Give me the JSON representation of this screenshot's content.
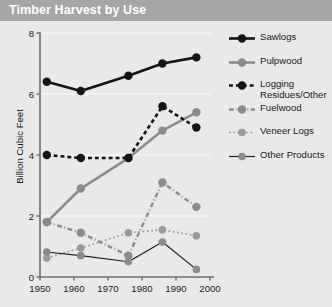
{
  "titlebar": {
    "title": "Timber Harvest by Use"
  },
  "chart_data": {
    "type": "line",
    "title": "Timber Harvest by Use",
    "xlabel": "",
    "ylabel": "Billion Cubic Feet",
    "xlim": [
      1950,
      2000
    ],
    "ylim": [
      0,
      8
    ],
    "xticks": [
      1950,
      1960,
      1970,
      1980,
      1990,
      2000
    ],
    "yticks": [
      0,
      2,
      4,
      6,
      8
    ],
    "xtick_labels": [
      "1950",
      "1960",
      "1970",
      "1980",
      "1990",
      "2000"
    ],
    "ytick_labels": [
      "0",
      "2",
      "4",
      "6",
      "8"
    ],
    "grid": "horizontal",
    "legend_position": "right",
    "x": [
      1952,
      1962,
      1976,
      1986,
      1996
    ],
    "series": [
      {
        "name": "Sawlogs",
        "values": [
          6.4,
          6.1,
          6.6,
          7.0,
          7.2
        ],
        "color": "#141414",
        "line": "solid",
        "width": 2.6,
        "marker": "circle",
        "marker_color": "#141414",
        "marker_size": 4.2
      },
      {
        "name": "Pulpwood",
        "values": [
          1.8,
          2.9,
          3.9,
          4.8,
          5.4
        ],
        "color": "#8c8c8c",
        "line": "solid",
        "width": 2.6,
        "marker": "circle",
        "marker_color": "#8c8c8c",
        "marker_size": 4.2
      },
      {
        "name": "Logging Residues/Other",
        "values": [
          4.0,
          3.9,
          3.9,
          5.6,
          4.9
        ],
        "color": "#141414",
        "line": "dashed",
        "width": 2.6,
        "marker": "circle",
        "marker_color": "#141414",
        "marker_size": 4.2
      },
      {
        "name": "Fuelwood",
        "values": [
          1.8,
          1.45,
          0.7,
          3.1,
          2.3
        ],
        "color": "#8c8c8c",
        "line": "dashdot",
        "width": 2.4,
        "marker": "circle",
        "marker_color": "#8c8c8c",
        "marker_size": 4.2
      },
      {
        "name": "Veneer Logs",
        "values": [
          0.62,
          0.95,
          1.45,
          1.55,
          1.35
        ],
        "color": "#9a9a9a",
        "line": "dotted",
        "width": 1.7,
        "marker": "circle",
        "marker_color": "#9a9a9a",
        "marker_size": 3.8
      },
      {
        "name": "Other Products",
        "values": [
          0.82,
          0.7,
          0.5,
          1.15,
          0.25
        ],
        "color": "#1f1f1f",
        "line": "solid",
        "width": 1.2,
        "marker": "circle",
        "marker_color": "#8c8c8c",
        "marker_size": 3.8
      }
    ],
    "legend_entries": [
      {
        "label": "Sawlogs"
      },
      {
        "label": "Pulpwood"
      },
      {
        "label": "Logging Residues/Other"
      },
      {
        "label": "Fuelwood"
      },
      {
        "label": "Veneer Logs"
      },
      {
        "label": "Other Products"
      }
    ]
  },
  "colors": {
    "page_background": "#e9e9e9",
    "titlebar_background": "#a6a6a6",
    "titlebar_text": "#ffffff",
    "axis": "#6e6e6e",
    "gridline": "#f4f4f4",
    "text": "#1a1a1a"
  }
}
